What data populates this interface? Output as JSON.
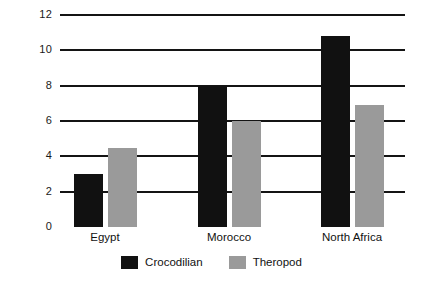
{
  "chart_data": {
    "type": "bar",
    "title": "",
    "subtitle": "",
    "xlabel": "",
    "ylabel": "",
    "categories": [
      "Egypt",
      "Morocco",
      "North Africa"
    ],
    "series": [
      {
        "name": "Crocodilian",
        "color": "#111111",
        "values": [
          3.0,
          8.0,
          10.8
        ]
      },
      {
        "name": "Theropod",
        "color": "#9a9a9a",
        "values": [
          4.5,
          6.0,
          6.9
        ]
      }
    ],
    "ylim": [
      0,
      12
    ],
    "yticks": [
      0,
      2,
      4,
      6,
      8,
      10,
      12
    ],
    "ytick_labels": [
      "0",
      "2",
      "4",
      "6",
      "8",
      "10",
      "12"
    ],
    "xtick_labels": [
      "Egypt",
      "Morocco",
      "North Africa"
    ],
    "grid": true,
    "grid_axis": "y",
    "grid_color": "#141414",
    "legend": {
      "position": "bottom-center",
      "entries": [
        {
          "label": "Crocodilian",
          "color": "#111111"
        },
        {
          "label": "Theropod",
          "color": "#9a9a9a"
        }
      ]
    },
    "background": "#ffffff",
    "annotations": []
  }
}
